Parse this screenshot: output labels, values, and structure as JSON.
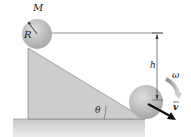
{
  "diagram": {
    "type": "physics-incline",
    "labels": {
      "mass": "M",
      "radius": "R",
      "height": "h",
      "angle": "θ",
      "angular_velocity": "ω",
      "velocity": "v"
    },
    "colors": {
      "sphere": "#b8b8b8",
      "incline": "#cfcfcf",
      "ground": "#d6d6d6",
      "line": "#444444",
      "arrow": "#111111"
    }
  }
}
